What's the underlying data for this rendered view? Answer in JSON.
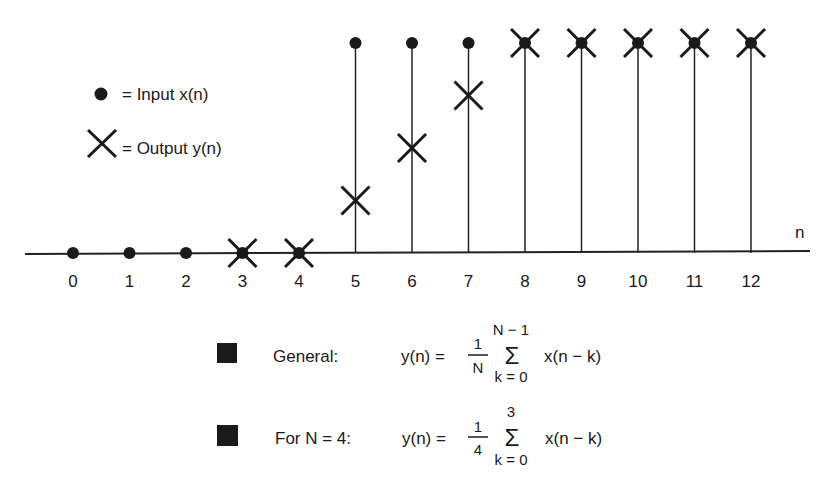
{
  "legend": {
    "input_label": "= Input x(n)",
    "output_label": "= Output y(n)"
  },
  "axis": {
    "label": "n",
    "ticks": [
      "0",
      "1",
      "2",
      "3",
      "4",
      "5",
      "6",
      "7",
      "8",
      "9",
      "10",
      "11",
      "12"
    ]
  },
  "formulas": {
    "general": {
      "label": "General:",
      "lhs": "y(n) =",
      "frac_num": "1",
      "frac_den": "N",
      "sum_upper": "N − 1",
      "sum_lower": "k = 0",
      "sigma": "Σ",
      "term": "x(n − k)"
    },
    "n4": {
      "label": "For N = 4:",
      "lhs": "y(n) =",
      "frac_num": "1",
      "frac_den": "4",
      "sum_upper": "3",
      "sum_lower": "k = 0",
      "sigma": "Σ",
      "term": "x(n − k)"
    }
  },
  "chart_data": {
    "type": "stem",
    "title": "",
    "xlabel": "n",
    "x": [
      0,
      1,
      2,
      3,
      4,
      5,
      6,
      7,
      8,
      9,
      10,
      11,
      12
    ],
    "series": [
      {
        "name": "Input x(n)",
        "marker": "dot",
        "values": [
          0,
          0,
          0,
          0,
          0,
          1,
          1,
          1,
          1,
          1,
          1,
          1,
          1
        ]
      },
      {
        "name": "Output y(n)",
        "marker": "x",
        "values": [
          null,
          null,
          null,
          0,
          0,
          0.25,
          0.5,
          0.75,
          1,
          1,
          1,
          1,
          1
        ]
      }
    ],
    "ylim": [
      0,
      1
    ],
    "grid": false,
    "legend_position": "upper-left"
  }
}
